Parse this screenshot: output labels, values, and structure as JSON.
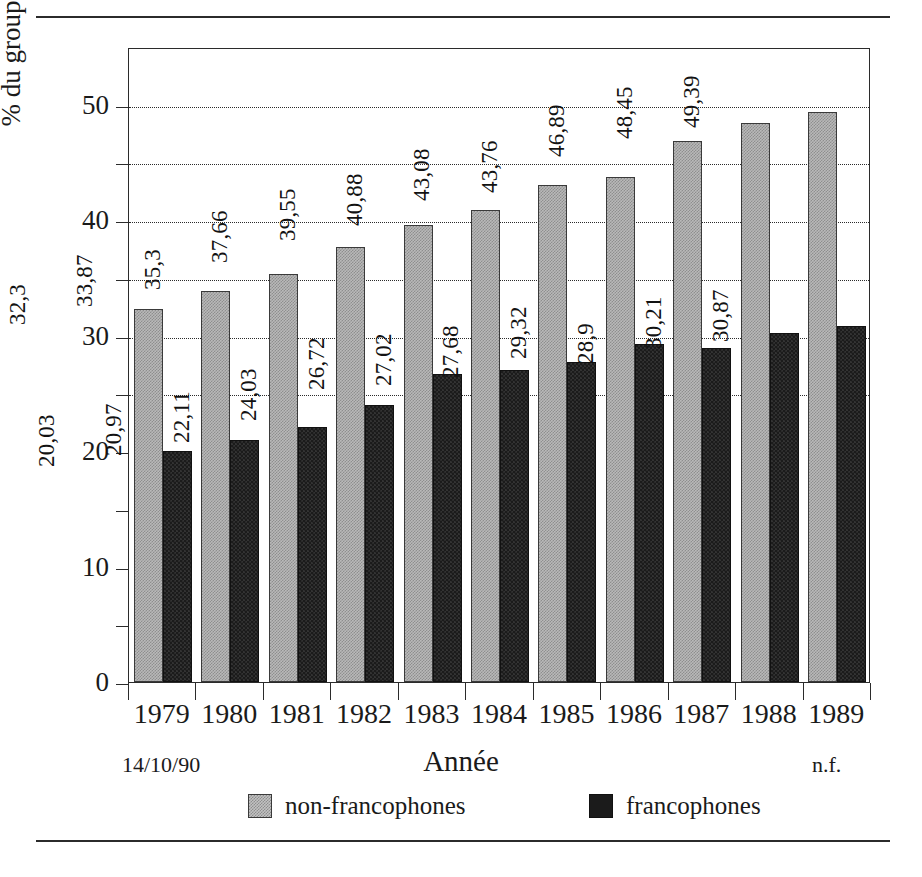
{
  "chart_data": {
    "type": "bar",
    "title": "",
    "xlabel": "Année",
    "ylabel": "% du groupe d'âge 18-21 ans",
    "ylim": [
      0,
      55
    ],
    "yticks": [
      0,
      10,
      20,
      30,
      40,
      50
    ],
    "ytick_labels": [
      "0",
      "10",
      "20",
      "30",
      "40",
      "50"
    ],
    "minor_yticks": [
      5,
      15,
      25,
      35,
      45
    ],
    "gridlines": [
      25,
      30,
      35,
      40,
      45,
      50
    ],
    "grid": true,
    "legend_position": "bottom",
    "categories": [
      "1979",
      "1980",
      "1981",
      "1982",
      "1983",
      "1984",
      "1985",
      "1986",
      "1987",
      "1988",
      "1989"
    ],
    "series": [
      {
        "name": "non-francophones",
        "color": "#b9b9b9",
        "values": [
          32.3,
          33.87,
          35.3,
          37.66,
          39.55,
          40.88,
          43.08,
          43.76,
          46.89,
          48.45,
          49.39
        ],
        "labels": [
          "32,3",
          "33,87",
          "35,3",
          "37,66",
          "39,55",
          "40,88",
          "43,08",
          "43,76",
          "46,89",
          "48,45",
          "49,39"
        ]
      },
      {
        "name": "francophones",
        "color": "#1b1b1b",
        "values": [
          20.03,
          20.97,
          22.11,
          24.03,
          26.72,
          27.02,
          27.68,
          29.32,
          28.9,
          30.21,
          30.87
        ],
        "labels": [
          "20,03",
          "20,97",
          "22,11",
          "24,03",
          "26,72",
          "27,02",
          "27,68",
          "29,32",
          "28,9",
          "30,21",
          "30,87"
        ]
      }
    ]
  },
  "footnotes": {
    "left": "14/10/90",
    "right": "n.f."
  },
  "legend": {
    "items": [
      {
        "label": "non-francophones",
        "swatch": "light"
      },
      {
        "label": "francophones",
        "swatch": "dark"
      }
    ]
  }
}
